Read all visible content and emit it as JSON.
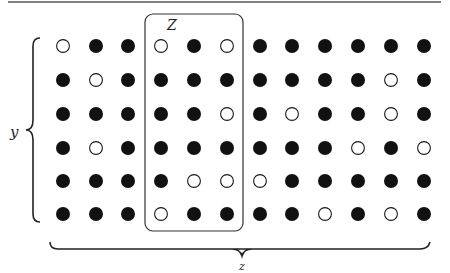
{
  "diagram": {
    "labels": {
      "z_box": "Z",
      "y_brace": "y",
      "z_brace": "z"
    },
    "colors": {
      "ink": "#1a1a1a",
      "filled": "#111111",
      "empty_fill": "#ffffff",
      "rule": "#555555"
    },
    "grid": {
      "columns": 12,
      "rows": 6,
      "col_x": [
        63,
        96,
        128,
        161,
        194,
        227,
        260,
        292,
        325,
        358,
        391,
        424
      ],
      "row_y": [
        46,
        80,
        114,
        148,
        181,
        214
      ],
      "radius": 7,
      "highlight_columns": [
        3,
        4,
        5
      ],
      "cells": [
        [
          0,
          1,
          1,
          0,
          1,
          0,
          1,
          1,
          1,
          1,
          1,
          1
        ],
        [
          1,
          0,
          1,
          1,
          1,
          1,
          1,
          1,
          1,
          1,
          0,
          1
        ],
        [
          1,
          1,
          1,
          1,
          1,
          0,
          1,
          0,
          1,
          1,
          0,
          1
        ],
        [
          1,
          0,
          1,
          1,
          1,
          1,
          1,
          1,
          1,
          0,
          1,
          0
        ],
        [
          1,
          1,
          1,
          1,
          0,
          0,
          0,
          1,
          1,
          1,
          1,
          1
        ],
        [
          1,
          1,
          1,
          0,
          1,
          1,
          1,
          1,
          0,
          1,
          0,
          1
        ]
      ]
    }
  }
}
